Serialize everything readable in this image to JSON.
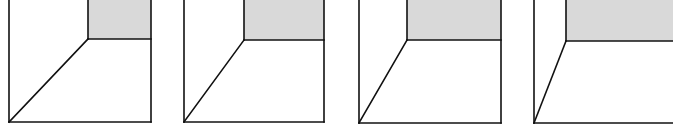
{
  "figure": {
    "colors": {
      "stroke": "#111111",
      "back_wall_fill": "#d9d9d9",
      "background": "#ffffff"
    },
    "panels": [
      {
        "left": 9,
        "right": 151,
        "bottom": 122,
        "wall_x": 88,
        "wall_y": 39
      },
      {
        "left": 184,
        "right": 324,
        "bottom": 122,
        "wall_x": 244,
        "wall_y": 40
      },
      {
        "left": 359,
        "right": 501,
        "bottom": 123,
        "wall_x": 407,
        "wall_y": 40
      },
      {
        "left": 534,
        "right": 673,
        "bottom": 123,
        "wall_x": 566,
        "wall_y": 41,
        "open_right": true
      }
    ]
  }
}
